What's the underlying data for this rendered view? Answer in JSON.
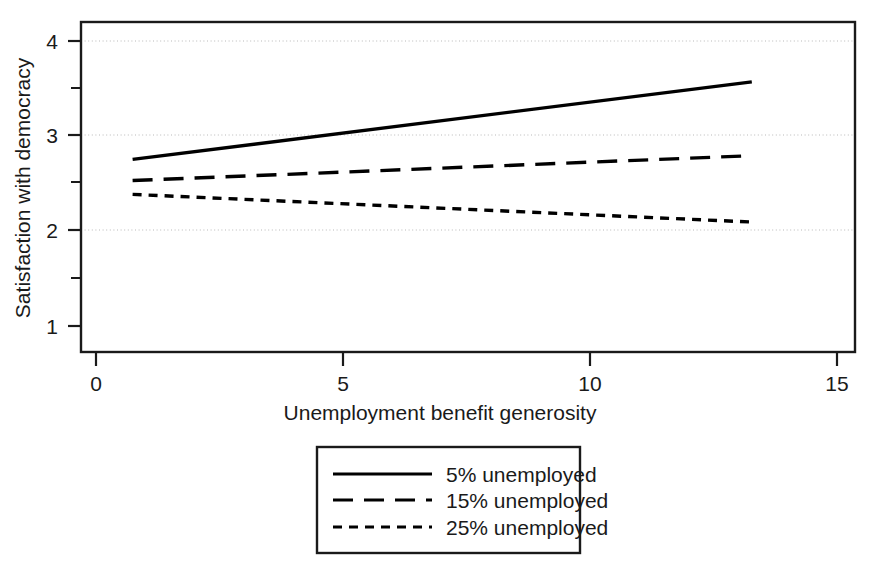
{
  "chart_data": {
    "type": "line",
    "title": "",
    "xlabel": "Unemployment benefit generosity",
    "ylabel": "Satisfaction with democracy",
    "xlim": [
      0,
      15
    ],
    "ylim": [
      0.62,
      4.2
    ],
    "x_ticks": [
      0,
      5,
      10,
      15
    ],
    "x_tick_labels": [
      "0",
      "5",
      "10",
      "15"
    ],
    "x_minor_ticks": [],
    "y_ticks": [
      1,
      2,
      3,
      4
    ],
    "y_tick_labels": [
      "1",
      "2",
      "3",
      "4"
    ],
    "y_minor_ticks": [
      1.5,
      2.5,
      3.5
    ],
    "gridlines": {
      "enabled": true,
      "axis": "y",
      "values": [
        2,
        3,
        4
      ],
      "style": "dotted"
    },
    "legend_position": "below-center",
    "x": [
      1,
      13
    ],
    "series": [
      {
        "name": "5% unemployed",
        "style": "solid",
        "values": [
          2.71,
          3.55
        ]
      },
      {
        "name": "15% unemployed",
        "style": "dashed",
        "values": [
          2.48,
          2.75
        ]
      },
      {
        "name": "25% unemployed",
        "style": "dotted",
        "values": [
          2.33,
          2.03
        ]
      }
    ]
  },
  "axes": {
    "x_title": "Unemployment benefit generosity",
    "y_title": "Satisfaction with democracy",
    "x_tick_0": "0",
    "x_tick_1": "5",
    "x_tick_2": "10",
    "x_tick_3": "15",
    "y_tick_0": "1",
    "y_tick_1": "2",
    "y_tick_2": "3",
    "y_tick_3": "4"
  },
  "legend": {
    "entry_0": "5% unemployed",
    "entry_1": "15% unemployed",
    "entry_2": "25% unemployed"
  },
  "colors": {
    "line": "#000000",
    "axis": "#1a1a1a",
    "grid": "#b9b9b9",
    "background": "#ffffff"
  }
}
